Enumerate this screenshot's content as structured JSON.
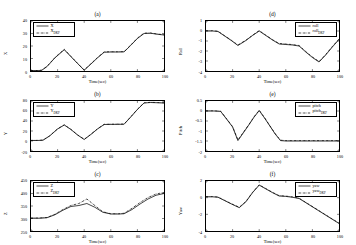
{
  "figure": {
    "width": 356,
    "height": 245,
    "background": "#ffffff",
    "line_color_true": "#000000",
    "line_color_est": "#000000",
    "xlabel": "Time(sec)"
  },
  "chart_data": [
    {
      "type": "line",
      "panel": "(a)",
      "title": "(a)",
      "xlabel": "Time(sec)",
      "ylabel": "X",
      "xlim": [
        0,
        100
      ],
      "ylim": [
        0,
        40
      ],
      "xticks": [
        0,
        20,
        40,
        60,
        80,
        100
      ],
      "yticks": [
        0,
        10,
        20,
        30,
        40
      ],
      "grid": false,
      "legend_position": "upper-left",
      "legend": [
        "X",
        "X_DKF"
      ],
      "series": [
        {
          "name": "X",
          "style": "solid",
          "x": [
            0,
            5,
            8,
            12,
            18,
            25,
            30,
            35,
            40,
            45,
            50,
            55,
            60,
            65,
            70,
            75,
            80,
            85,
            90,
            95,
            100
          ],
          "values": [
            0.3,
            0.3,
            0.5,
            3.5,
            10.5,
            17.0,
            11.5,
            6.0,
            0.6,
            5.5,
            10.5,
            15.0,
            15.2,
            15.2,
            15.3,
            20.5,
            26.0,
            30.0,
            30.2,
            29.4,
            28.8
          ]
        },
        {
          "name": "X_DKF",
          "style": "dash-dot",
          "x": [
            0,
            5,
            8,
            12,
            18,
            25,
            30,
            35,
            40,
            45,
            50,
            55,
            60,
            65,
            70,
            75,
            80,
            85,
            90,
            95,
            100
          ],
          "values": [
            0.4,
            0.4,
            0.7,
            3.7,
            10.8,
            17.4,
            11.8,
            6.2,
            0.9,
            5.8,
            10.8,
            15.3,
            15.4,
            15.4,
            15.5,
            20.8,
            26.3,
            30.3,
            30.4,
            29.6,
            29.0
          ]
        }
      ]
    },
    {
      "type": "line",
      "panel": "(b)",
      "title": "(b)",
      "xlabel": "Time(sec)",
      "ylabel": "Y",
      "xlim": [
        0,
        100
      ],
      "ylim": [
        -20,
        80
      ],
      "xticks": [
        0,
        20,
        40,
        60,
        80,
        100
      ],
      "yticks": [
        -20,
        0,
        20,
        40,
        60,
        80
      ],
      "grid": false,
      "legend_position": "upper-left",
      "legend": [
        "Y",
        "Y_DKF"
      ],
      "series": [
        {
          "name": "Y",
          "style": "solid",
          "x": [
            0,
            5,
            9,
            14,
            20,
            25,
            30,
            35,
            40,
            45,
            50,
            55,
            60,
            65,
            70,
            75,
            80,
            85,
            90,
            95,
            100
          ],
          "values": [
            1.0,
            1.0,
            1.5,
            10.0,
            24.0,
            32.0,
            23.0,
            12.0,
            3.0,
            13.0,
            24.0,
            33.0,
            33.2,
            33.3,
            33.5,
            48.0,
            63.0,
            76.0,
            77.0,
            76.5,
            76.0
          ]
        },
        {
          "name": "Y_DKF",
          "style": "dash-dot",
          "x": [
            0,
            5,
            9,
            14,
            20,
            25,
            30,
            35,
            40,
            45,
            50,
            55,
            60,
            65,
            70,
            75,
            80,
            85,
            90,
            95,
            100
          ],
          "values": [
            1.3,
            1.3,
            1.9,
            10.4,
            24.4,
            32.4,
            23.4,
            12.4,
            3.4,
            13.4,
            24.4,
            33.4,
            33.6,
            33.7,
            33.9,
            48.4,
            63.4,
            76.4,
            77.4,
            76.9,
            76.4
          ]
        }
      ]
    },
    {
      "type": "line",
      "panel": "(c)",
      "title": "(c)",
      "xlabel": "Time(sec)",
      "ylabel": "Z",
      "xlim": [
        0,
        100
      ],
      "ylim": [
        250,
        450
      ],
      "xticks": [
        0,
        20,
        40,
        60,
        80,
        100
      ],
      "yticks": [
        250,
        300,
        350,
        400,
        450
      ],
      "grid": false,
      "legend_position": "upper-left",
      "legend": [
        "Z",
        "Z_DKF"
      ],
      "series": [
        {
          "name": "Z",
          "style": "solid",
          "x": [
            0,
            6,
            12,
            18,
            24,
            30,
            36,
            42,
            48,
            54,
            60,
            66,
            70,
            76,
            82,
            88,
            94,
            100
          ],
          "values": [
            301,
            301,
            303,
            315,
            333,
            348,
            352,
            360,
            345,
            325,
            318,
            318,
            319,
            336,
            358,
            378,
            393,
            400
          ]
        },
        {
          "name": "Z_DKF",
          "style": "dash-dot",
          "x": [
            0,
            6,
            12,
            18,
            24,
            30,
            36,
            42,
            48,
            54,
            60,
            66,
            70,
            76,
            82,
            88,
            94,
            100
          ],
          "values": [
            302,
            302,
            304,
            317,
            336,
            352,
            360,
            378,
            352,
            327,
            319,
            319,
            321,
            341,
            364,
            384,
            398,
            404
          ]
        }
      ]
    },
    {
      "type": "line",
      "panel": "(d)",
      "title": "(d)",
      "xlabel": "Time(sec)",
      "ylabel": "Roll",
      "xlim": [
        0,
        100
      ],
      "ylim": [
        -4,
        1
      ],
      "xticks": [
        0,
        20,
        40,
        60,
        80,
        100
      ],
      "yticks": [
        1,
        0,
        -1,
        -2,
        -3,
        -4
      ],
      "grid": false,
      "legend_position": "upper-right",
      "legend": [
        "roll",
        "roll_DKF"
      ],
      "series": [
        {
          "name": "roll",
          "style": "solid",
          "x": [
            0,
            5,
            9,
            14,
            19,
            24,
            30,
            35,
            40,
            45,
            50,
            55,
            60,
            65,
            70,
            75,
            80,
            85,
            90,
            95,
            100
          ],
          "values": [
            0.0,
            0.0,
            -0.05,
            -0.5,
            -0.95,
            -1.45,
            -0.95,
            -0.45,
            0.0,
            -0.45,
            -0.9,
            -1.3,
            -1.35,
            -1.4,
            -1.5,
            -2.1,
            -2.65,
            -3.1,
            -2.4,
            -1.6,
            -0.85
          ]
        },
        {
          "name": "roll_DKF",
          "style": "dash-dot",
          "x": [
            0,
            5,
            9,
            14,
            19,
            24,
            30,
            35,
            40,
            45,
            50,
            55,
            60,
            65,
            70,
            75,
            80,
            85,
            90,
            95,
            100
          ],
          "values": [
            0.03,
            0.03,
            -0.02,
            -0.47,
            -0.92,
            -1.4,
            -0.92,
            -0.42,
            0.04,
            -0.42,
            -0.87,
            -1.25,
            -1.3,
            -1.36,
            -1.45,
            -2.05,
            -2.6,
            -3.05,
            -2.35,
            -1.55,
            -0.8
          ]
        }
      ]
    },
    {
      "type": "line",
      "panel": "(e)",
      "title": "(e)",
      "xlabel": "Time(sec)",
      "ylabel": "Pitch",
      "xlim": [
        0,
        100
      ],
      "ylim": [
        -2,
        0.5
      ],
      "xticks": [
        0,
        20,
        40,
        60,
        80,
        100
      ],
      "yticks": [
        0.5,
        0,
        -0.5,
        -1,
        -1.5,
        -2
      ],
      "grid": false,
      "legend_position": "upper-right",
      "legend": [
        "pitch",
        "pitch_DKF"
      ],
      "series": [
        {
          "name": "pitch",
          "style": "solid",
          "x": [
            0,
            6,
            11,
            16,
            20,
            24,
            28,
            32,
            36,
            40,
            44,
            48,
            52,
            56,
            60,
            70,
            80,
            90,
            100
          ],
          "values": [
            0.0,
            0.0,
            -0.02,
            -0.45,
            -0.8,
            -1.48,
            -1.1,
            -0.72,
            -0.32,
            0.02,
            -0.35,
            -0.75,
            -1.15,
            -1.48,
            -1.5,
            -1.5,
            -1.5,
            -1.5,
            -1.5
          ]
        },
        {
          "name": "pitch_DKF",
          "style": "dash-dot",
          "x": [
            0,
            6,
            11,
            16,
            20,
            24,
            28,
            32,
            36,
            40,
            44,
            48,
            52,
            56,
            60,
            70,
            80,
            90,
            100
          ],
          "values": [
            0.01,
            0.01,
            -0.01,
            -0.43,
            -0.78,
            -1.45,
            -1.07,
            -0.7,
            -0.3,
            0.04,
            -0.33,
            -0.73,
            -1.13,
            -1.46,
            -1.48,
            -1.48,
            -1.48,
            -1.48,
            -1.48
          ]
        }
      ]
    },
    {
      "type": "line",
      "panel": "(f)",
      "title": "(f)",
      "xlabel": "Time(sec)",
      "ylabel": "Yaw",
      "xlim": [
        0,
        100
      ],
      "ylim": [
        -4,
        2
      ],
      "xticks": [
        0,
        20,
        40,
        60,
        80,
        100
      ],
      "yticks": [
        2,
        0,
        -2,
        -4
      ],
      "grid": false,
      "legend_position": "upper-right",
      "legend": [
        "yaw",
        "yaw_DKF"
      ],
      "series": [
        {
          "name": "yaw",
          "style": "solid",
          "x": [
            0,
            5,
            9,
            14,
            19,
            25,
            30,
            35,
            40,
            45,
            50,
            55,
            60,
            65,
            70,
            78,
            86,
            94,
            100
          ],
          "values": [
            0.1,
            0.1,
            0.05,
            -0.35,
            -0.75,
            -1.2,
            -0.5,
            0.6,
            1.5,
            1.05,
            0.6,
            0.2,
            0.15,
            0.05,
            -0.1,
            -0.9,
            -1.7,
            -2.5,
            -3.1
          ]
        },
        {
          "name": "yaw_DKF",
          "style": "dash-dot",
          "x": [
            0,
            5,
            9,
            14,
            19,
            25,
            30,
            35,
            40,
            45,
            50,
            55,
            60,
            65,
            70,
            78,
            86,
            94,
            100
          ],
          "values": [
            0.13,
            0.13,
            0.08,
            -0.32,
            -0.72,
            -1.15,
            -0.45,
            0.64,
            1.55,
            1.09,
            0.64,
            0.24,
            0.19,
            0.09,
            -0.06,
            -0.86,
            -1.66,
            -2.46,
            -3.05
          ]
        }
      ]
    }
  ]
}
